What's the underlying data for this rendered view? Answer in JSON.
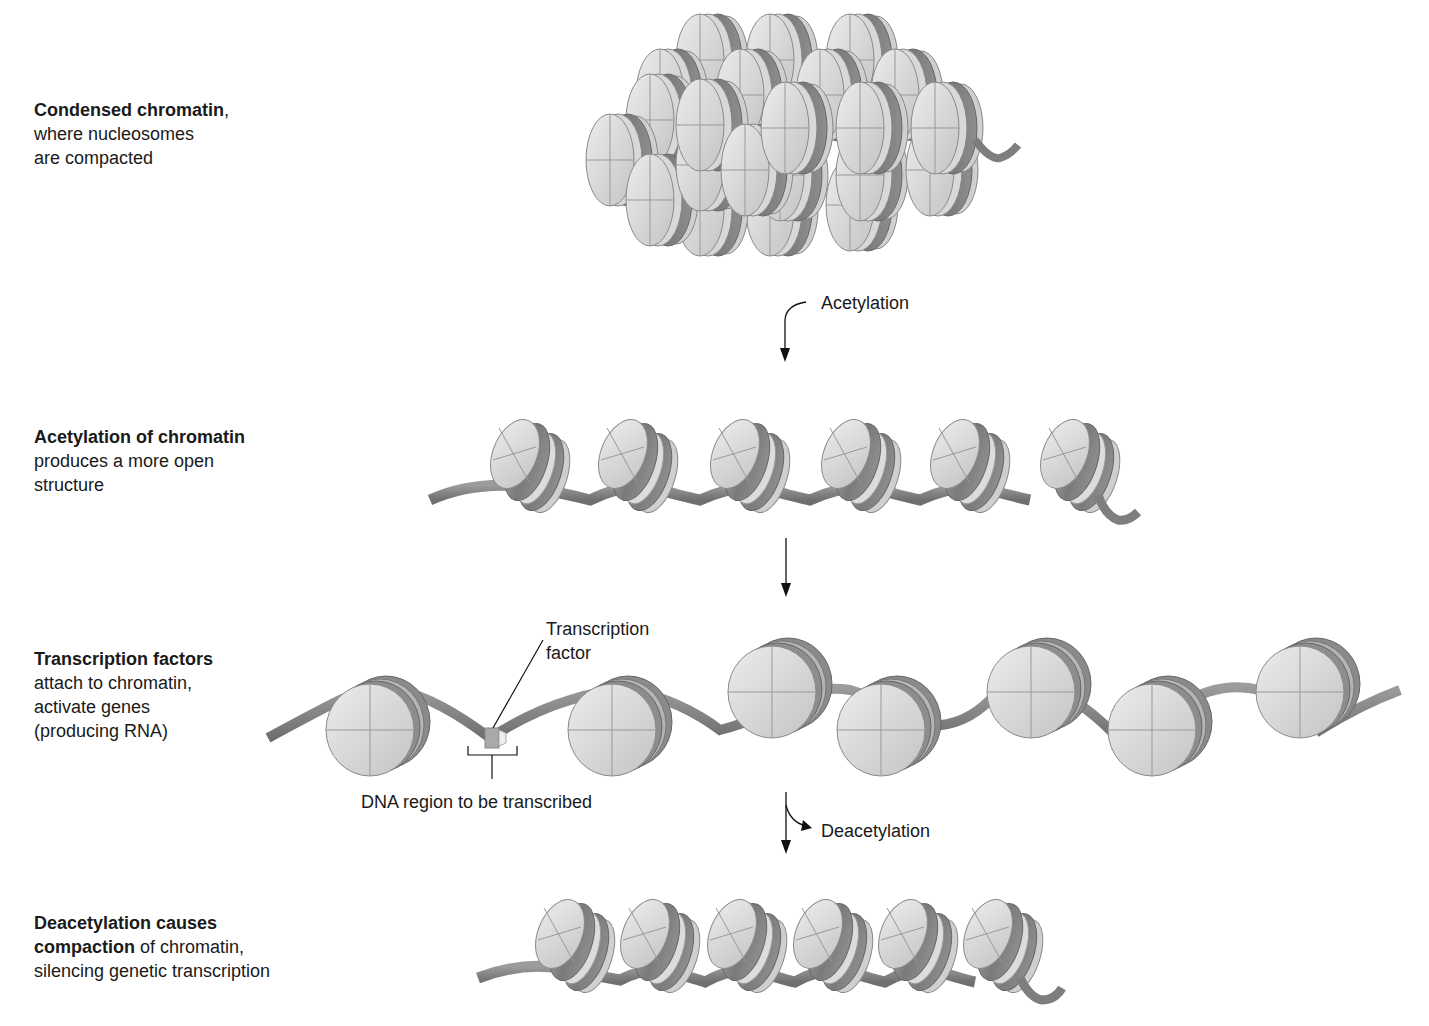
{
  "colors": {
    "background": "#ffffff",
    "text": "#1a1a1a",
    "histone_face": "#d4d4d4",
    "histone_face_light": "#e6e6e6",
    "dna_dark": "#7a7a7a",
    "dna_mid": "#8f8f8f",
    "dna_light": "#b8b8b8",
    "histone_edge": "#9a9a9a",
    "tf_box": "#a8a8a8"
  },
  "stages": [
    {
      "id": "condensed",
      "title": "Condensed chromatin",
      "title_suffix": ",",
      "lines": [
        "where nucleosomes",
        "are compacted"
      ]
    },
    {
      "id": "acetylated",
      "title": "Acetylation of chromatin",
      "title_suffix": "",
      "lines": [
        "produces a more open",
        "structure"
      ]
    },
    {
      "id": "transcription",
      "title": "Transcription factors",
      "title_suffix": "",
      "lines": [
        "attach to chromatin,",
        "activate genes",
        "(producing RNA)"
      ]
    },
    {
      "id": "deacetylated",
      "title": "Deacetylation causes",
      "title_line2_bold": "compaction",
      "title_line2_rest": " of chromatin,",
      "lines": [
        "silencing genetic transcription"
      ]
    }
  ],
  "arrows": [
    {
      "id": "acetylation-arrow",
      "label": "Acetylation"
    },
    {
      "id": "plain-arrow",
      "label": ""
    },
    {
      "id": "deacetylation-arrow",
      "label": "Deacetylation"
    }
  ],
  "annotations": {
    "transcription_factor": [
      "Transcription",
      "factor"
    ],
    "dna_region": "DNA region to be transcribed"
  },
  "diagram": {
    "open_nucleosomes_count": 6,
    "transcription_nucleosomes_count": 7,
    "compact_nucleosomes_count": 6,
    "condensed_nucleosome_rows": 5
  }
}
